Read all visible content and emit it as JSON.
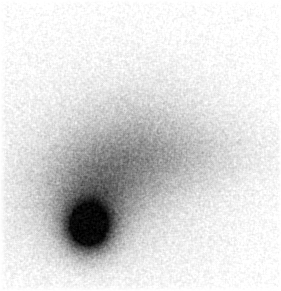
{
  "image": {
    "kind": "inverted-grayscale-astronomical-photo",
    "subject": "comet",
    "alt": "Inverted grayscale image of a comet: a dense dark nucleus at lower left surrounded by a diffuse coma, with a faint broad tail extending toward the upper right, over a lightly grainy white background.",
    "width": 281,
    "height": 291,
    "background_color": "#ffffff",
    "ink_min_gray": "#0e0e0e",
    "max_intensity": 0.97,
    "margins": {
      "left": 6,
      "top": 5,
      "right": 3,
      "bottom": 5
    },
    "noise": {
      "base_sigma": 0.035,
      "midtone_extra": 0.03,
      "grain_blur": true,
      "blur_gain": 1.35,
      "seed": 42
    },
    "components": [
      {
        "name": "outer-halo",
        "amplitude": 0.12,
        "cx": 114,
        "cy": 172,
        "sx": 86,
        "sy": 74,
        "angle": 0
      },
      {
        "name": "coma",
        "amplitude": 0.3,
        "cx": 112,
        "cy": 168,
        "sx": 56,
        "sy": 36,
        "angle": -32
      },
      {
        "name": "inner-coma",
        "amplitude": 0.22,
        "cx": 96,
        "cy": 203,
        "sx": 27,
        "sy": 27,
        "angle": 0
      },
      {
        "name": "tail",
        "amplitude": 0.11,
        "cx": 180,
        "cy": 158,
        "sx": 62,
        "sy": 22,
        "angle": -6
      },
      {
        "name": "nucleus-shoulder",
        "amplitude": 0.48,
        "cx": 88,
        "cy": 227,
        "sx": 19,
        "sy": 20,
        "angle": 0
      },
      {
        "name": "nucleus-core",
        "amplitude": 0.95,
        "cx": 88,
        "cy": 227,
        "sx": 13,
        "sy": 14,
        "angle": 0
      }
    ]
  }
}
